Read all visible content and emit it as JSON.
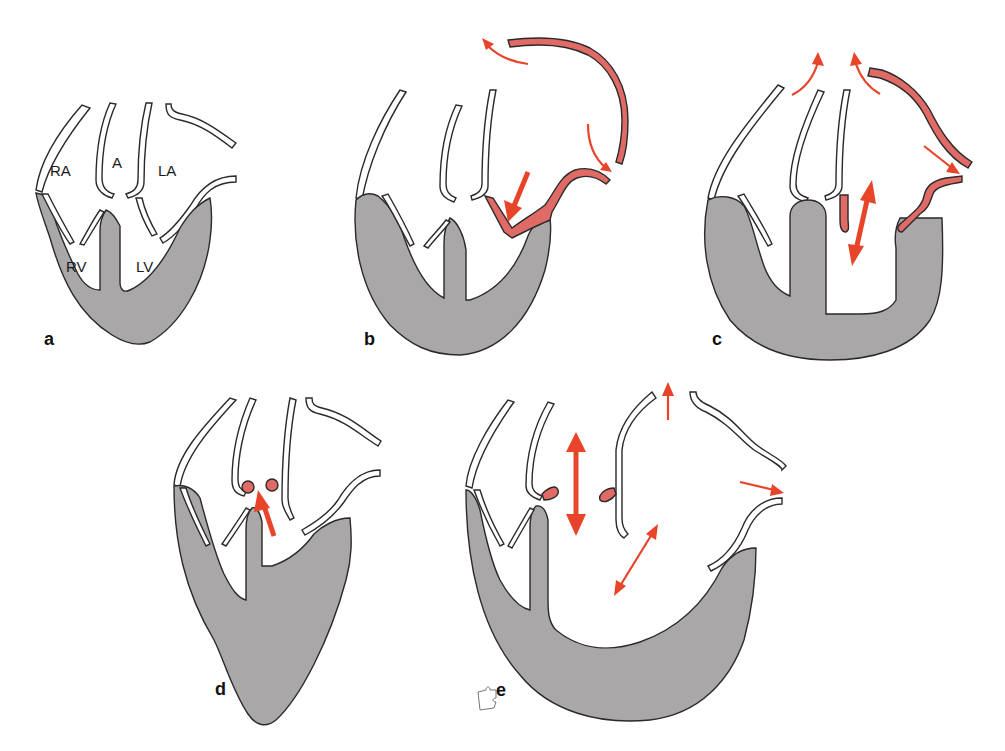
{
  "figure": {
    "panels": [
      {
        "id": "a",
        "label": "a",
        "description": "Normal heart"
      },
      {
        "id": "b",
        "label": "b",
        "description": "Left heart outflow; red anterior wall"
      },
      {
        "id": "c",
        "label": "c",
        "description": "Dilated ventricle with red aortic/atrial walls"
      },
      {
        "id": "d",
        "label": "d",
        "description": "Apical aneurysm with outflow arrow"
      },
      {
        "id": "e",
        "label": "e",
        "description": "Dilated left ventricle with regurgitation arrows"
      }
    ],
    "chamber_labels": {
      "ra": "RA",
      "a": "A",
      "la": "LA",
      "rv": "RV",
      "lv": "LV"
    }
  },
  "colors": {
    "myocardium": "#a9a7a8",
    "outline": "#2a2a2a",
    "highlight_wall": "#e06a66",
    "arrow": "#e8442a",
    "background": "#ffffff"
  }
}
